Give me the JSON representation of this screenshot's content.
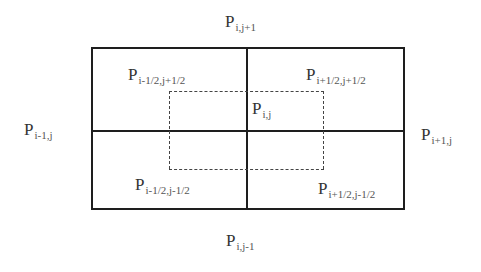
{
  "diagram": {
    "type": "staggered-grid-stencil",
    "labels": {
      "top": {
        "base": "P",
        "sub": "i,j+1"
      },
      "bottom": {
        "base": "P",
        "sub": "i,j-1"
      },
      "left": {
        "base": "P",
        "sub": "i-1,j"
      },
      "right": {
        "base": "P",
        "sub": "i+1,j"
      },
      "center": {
        "base": "P",
        "sub": "i,j"
      },
      "top_left": {
        "base": "P",
        "sub": "i-1/2,j+1/2"
      },
      "top_right": {
        "base": "P",
        "sub": "i+1/2,j+1/2"
      },
      "bottom_left": {
        "base": "P",
        "sub": "i-1/2,j-1/2"
      },
      "bottom_right": {
        "base": "P",
        "sub": "i+1/2,j-1/2"
      }
    },
    "styles": {
      "line_color": "#1e1e1e",
      "dash_color": "#444444",
      "background": "#ffffff"
    }
  }
}
